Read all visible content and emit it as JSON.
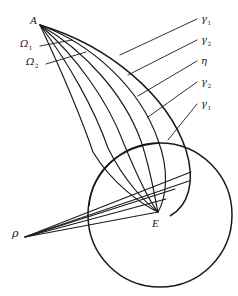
{
  "figure": {
    "type": "geometric-diagram",
    "background": "#ffffff",
    "stroke_color": "#1a1a1a",
    "width": 238,
    "height": 296
  },
  "points": {
    "apex_a": {
      "label": "A",
      "x": 40,
      "y": 25
    },
    "apex_rho": {
      "label": "ρ",
      "x": 25,
      "y": 237
    },
    "convergence_e": {
      "label": "E",
      "x": 158,
      "y": 212
    }
  },
  "circle": {
    "cx": 160,
    "cy": 215,
    "r": 72
  },
  "curve_labels": [
    {
      "label": "γ",
      "sub": "1",
      "x": 200,
      "y": 20
    },
    {
      "label": "γ",
      "sub": "2",
      "x": 200,
      "y": 41
    },
    {
      "label": "η",
      "sub": "",
      "x": 200,
      "y": 62
    },
    {
      "label": "γ",
      "sub": "2",
      "x": 200,
      "y": 83
    },
    {
      "label": "γ",
      "sub": "1",
      "x": 200,
      "y": 105
    }
  ],
  "region_labels": [
    {
      "label": "Ω",
      "sub": "1",
      "x": 22,
      "y": 45
    },
    {
      "label": "Ω",
      "sub": "2",
      "x": 28,
      "y": 63
    }
  ],
  "point_labels": [
    {
      "label": "A",
      "x": 30,
      "y": 17
    },
    {
      "label": "E",
      "x": 152,
      "y": 224
    },
    {
      "label": "ρ",
      "x": 12,
      "y": 232
    }
  ]
}
